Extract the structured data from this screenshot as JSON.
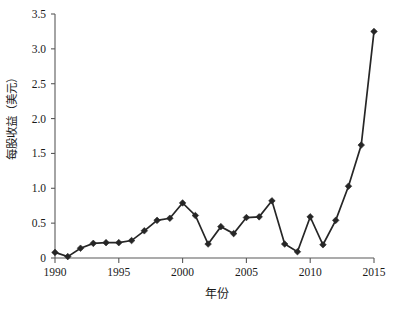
{
  "chart_data": {
    "type": "line",
    "title": "",
    "subtitle": "",
    "xlabel": "年份",
    "ylabel": "每股收益（美元）",
    "x": [
      1990,
      1991,
      1992,
      1993,
      1994,
      1995,
      1996,
      1997,
      1998,
      1999,
      2000,
      2001,
      2002,
      2003,
      2004,
      2005,
      2006,
      2007,
      2008,
      2009,
      2010,
      2011,
      2012,
      2013,
      2014,
      2015
    ],
    "values": [
      0.08,
      0.02,
      0.14,
      0.21,
      0.22,
      0.22,
      0.25,
      0.39,
      0.54,
      0.57,
      0.79,
      0.61,
      0.2,
      0.45,
      0.35,
      0.58,
      0.59,
      0.82,
      0.2,
      0.09,
      0.59,
      0.19,
      0.54,
      1.03,
      1.62,
      3.25
    ],
    "series": [
      {
        "name": "每股收益",
        "values": [
          0.08,
          0.02,
          0.14,
          0.21,
          0.22,
          0.22,
          0.25,
          0.39,
          0.54,
          0.57,
          0.79,
          0.61,
          0.2,
          0.45,
          0.35,
          0.58,
          0.59,
          0.82,
          0.2,
          0.09,
          0.59,
          0.19,
          0.54,
          1.03,
          1.62,
          3.25
        ],
        "color": "#262626",
        "marker": "diamond"
      }
    ],
    "xlim": [
      1990,
      2015
    ],
    "ylim": [
      0,
      3.5
    ],
    "xticks": [
      1990,
      1995,
      2000,
      2005,
      2010,
      2015
    ],
    "xtick_labels": [
      "1990",
      "1995",
      "2000",
      "2005",
      "2010",
      "2015"
    ],
    "yticks": [
      0,
      0.5,
      1.0,
      1.5,
      2.0,
      2.5,
      3.0,
      3.5
    ],
    "ytick_labels": [
      "0",
      "0.5",
      "1.0",
      "1.5",
      "2.0",
      "2.5",
      "3.0",
      "3.5"
    ],
    "grid": false,
    "legend": false,
    "legend_position": "none",
    "annotations": [],
    "axis_color": "#595959",
    "background_color": "#ffffff"
  }
}
